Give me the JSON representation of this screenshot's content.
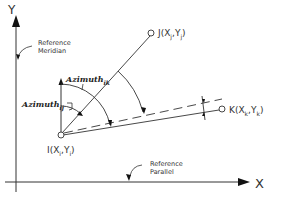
{
  "diagram": {
    "title": "",
    "axes": {
      "x_label": "X",
      "y_label": "Y"
    },
    "annotations": {
      "reference_meridian": [
        "Reference",
        "Meridian"
      ],
      "reference_parallel": [
        "Reference",
        "Parallel"
      ]
    },
    "points": {
      "I": {
        "name": "I",
        "open": "(X",
        "sub1": "i",
        "mid": ",Y",
        "sub2": "i",
        "close": ")"
      },
      "J": {
        "name": "J",
        "open": "(X",
        "sub1": "j",
        "mid": ",Y",
        "sub2": "j",
        "close": ")"
      },
      "K": {
        "name": "K",
        "open": "(X",
        "sub1": "k",
        "mid": ",Y",
        "sub2": "k",
        "close": ")"
      }
    },
    "angles": {
      "azimuth_ij": {
        "label": "Azimuth",
        "sub": "ij"
      },
      "azimuth_ik": {
        "label": "Azimuth",
        "sub": "ik"
      }
    },
    "colors": {
      "line": "#333333",
      "background": "#ffffff"
    }
  }
}
